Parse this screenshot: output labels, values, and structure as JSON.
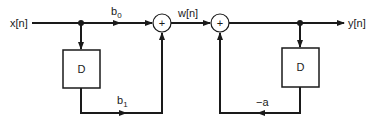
{
  "diagram": {
    "type": "block-diagram",
    "input_label": "x[n]",
    "output_label": "y[n]",
    "intermediate_label": "w[n]",
    "delay_blocks": [
      {
        "id": "delay-1",
        "label": "D"
      },
      {
        "id": "delay-2",
        "label": "D"
      }
    ],
    "adders": [
      {
        "id": "adder-1",
        "symbol": "+"
      },
      {
        "id": "adder-2",
        "symbol": "+"
      }
    ],
    "gains": {
      "b0": {
        "base": "b",
        "sub": "0"
      },
      "b1": {
        "base": "b",
        "sub": "1"
      },
      "a": "−a"
    },
    "colors": {
      "line": "#1a1a1a",
      "background": "#ffffff"
    }
  }
}
